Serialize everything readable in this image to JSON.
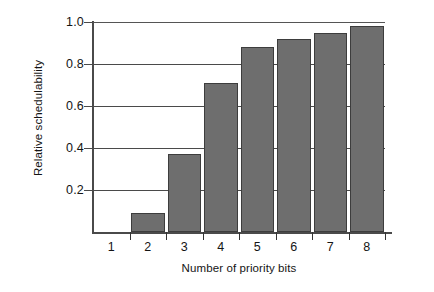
{
  "chart_data": {
    "type": "bar",
    "title": "",
    "xlabel": "Number of priority bits",
    "ylabel": "Relative schedulability",
    "categories": [
      "1",
      "2",
      "3",
      "4",
      "5",
      "6",
      "7",
      "8"
    ],
    "values": [
      0.0,
      0.09,
      0.37,
      0.71,
      0.88,
      0.92,
      0.95,
      0.98
    ],
    "ylim": [
      0.0,
      1.0
    ],
    "ytick_labels": [
      "0.2",
      "0.4",
      "0.6",
      "0.8",
      "1.0"
    ],
    "ytick_values": [
      0.2,
      0.4,
      0.6,
      0.8,
      1.0
    ],
    "grid": "horizontal",
    "legend": "none",
    "bar_color": "#6e6e6e",
    "bar_edge_color": "#3d3d3d",
    "axis_color": "#4a4a4a",
    "background": "#ffffff"
  }
}
